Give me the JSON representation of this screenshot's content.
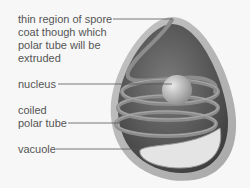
{
  "diagram": {
    "labels": [
      {
        "id": "spore-coat",
        "text": "thin region of spore\ncoat though which\npolar tube will be\nextruded"
      },
      {
        "id": "nucleus",
        "text": "nucleus"
      },
      {
        "id": "polar-tube",
        "text": "coiled\npolar tube"
      },
      {
        "id": "vacuole",
        "text": "vacuole"
      }
    ],
    "colors": {
      "background": "#f7f7f7",
      "text": "#555555",
      "leader_line": "#555555",
      "spore_coat": "#b5b5b5",
      "interior_dark": "#4a4a4a",
      "tube": "#8a8a8a",
      "nucleus": "#c8c8c8",
      "vacuole": "#e6e6e6"
    }
  }
}
